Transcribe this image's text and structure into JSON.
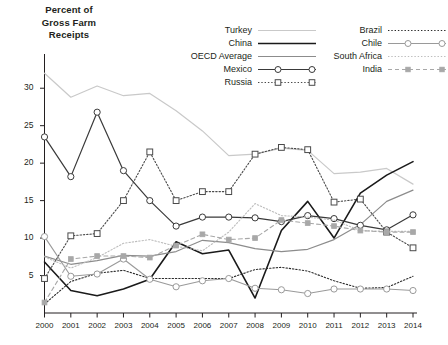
{
  "axis_title": "Percent of\nGross Farm\nReceipts",
  "axis_title_lines": [
    "Percent of",
    "Gross Farm",
    "Receipts"
  ],
  "legend": {
    "left_column": [
      {
        "label": "Turkey",
        "style": "solid-lightgray",
        "color": "#c9c9c9"
      },
      {
        "label": "China",
        "style": "solid-thick-black",
        "color": "#1a1a1a"
      },
      {
        "label": "OECD Average",
        "style": "solid-gray",
        "color": "#8c8c8c"
      },
      {
        "label": "Mexico",
        "style": "solid-marker-open-circle",
        "color": "#3a3a3a"
      },
      {
        "label": "Russia",
        "style": "dotted-marker-open-square",
        "color": "#4a4a4a"
      }
    ],
    "right_column": [
      {
        "label": "Brazil",
        "style": "dotted-dark",
        "color": "#2b2b2b"
      },
      {
        "label": "Chile",
        "style": "solid-marker-open-circle-light",
        "color": "#9a9a9a"
      },
      {
        "label": "South Africa",
        "style": "dotted-lightgray",
        "color": "#bdbdbd"
      },
      {
        "label": "India",
        "style": "dashed-marker-filled-square",
        "color": "#a8a8a8"
      }
    ]
  },
  "chart_data": {
    "type": "line",
    "title": "",
    "xlabel": "",
    "ylabel": "Percent of Gross Farm Receipts",
    "x": [
      2000,
      2001,
      2002,
      2003,
      2004,
      2005,
      2006,
      2007,
      2008,
      2009,
      2010,
      2011,
      2012,
      2013,
      2014
    ],
    "xtick_labels": [
      "2000",
      "2001",
      "2002",
      "2003",
      "2004",
      "2005",
      "2006",
      "2007",
      "2008",
      "2009",
      "2010",
      "2011",
      "2012",
      "2013",
      "2014"
    ],
    "ytick_labels": [
      "5",
      "10",
      "15",
      "20",
      "25",
      "30"
    ],
    "yticks": [
      5,
      10,
      15,
      20,
      25,
      30
    ],
    "ylim": [
      0,
      33.5
    ],
    "xlim": [
      2000,
      2014
    ],
    "grid": false,
    "legend_position": "top-right",
    "series": [
      {
        "name": "Turkey",
        "color": "#c9c9c9",
        "values": [
          32.0,
          28.8,
          30.3,
          29.0,
          29.3,
          27.0,
          24.3,
          21.0,
          21.2,
          22.0,
          21.7,
          18.6,
          18.8,
          19.3,
          17.2
        ],
        "marker": "none",
        "dash": "none",
        "width": 1.2
      },
      {
        "name": "China",
        "color": "#1a1a1a",
        "values": [
          6.8,
          3.0,
          2.3,
          3.2,
          4.5,
          9.5,
          7.9,
          8.4,
          2.0,
          11.0,
          14.9,
          10.0,
          16.0,
          18.4,
          20.2
        ],
        "marker": "none",
        "dash": "none",
        "width": 1.6
      },
      {
        "name": "OECD Average",
        "color": "#8c8c8c",
        "values": [
          7.6,
          6.5,
          7.0,
          7.7,
          7.6,
          8.2,
          9.7,
          9.4,
          8.6,
          8.2,
          8.5,
          9.8,
          11.8,
          14.9,
          16.4
        ],
        "marker": "none",
        "dash": "none",
        "width": 1.2
      },
      {
        "name": "Mexico",
        "color": "#3a3a3a",
        "values": [
          23.5,
          18.2,
          26.8,
          19.0,
          15.0,
          11.6,
          12.8,
          12.8,
          12.7,
          12.2,
          13.0,
          12.6,
          11.7,
          11.1,
          13.1
        ],
        "marker": "circle-open",
        "dash": "none",
        "width": 1.2
      },
      {
        "name": "Russia",
        "color": "#4a4a4a",
        "values": [
          4.6,
          10.3,
          10.6,
          15.0,
          21.5,
          15.0,
          16.2,
          16.2,
          21.2,
          22.1,
          21.8,
          14.8,
          15.2,
          10.8,
          8.7
        ],
        "marker": "square-open",
        "dash": "dotted",
        "width": 1.1
      },
      {
        "name": "Brazil",
        "color": "#2b2b2b",
        "values": [
          1.2,
          4.2,
          5.3,
          5.7,
          4.6,
          4.6,
          4.6,
          4.6,
          5.8,
          6.1,
          5.6,
          4.3,
          3.3,
          3.4,
          4.9
        ],
        "marker": "none",
        "dash": "dotted",
        "width": 1.1
      },
      {
        "name": "Chile",
        "color": "#9a9a9a",
        "values": [
          10.2,
          4.9,
          5.2,
          7.2,
          4.5,
          3.5,
          4.3,
          4.6,
          3.3,
          3.1,
          2.6,
          3.2,
          3.2,
          3.2,
          3.0
        ],
        "marker": "circle-open",
        "dash": "none",
        "width": 1.1
      },
      {
        "name": "South Africa",
        "color": "#bdbdbd",
        "values": [
          7.5,
          6.0,
          7.4,
          9.3,
          9.8,
          8.9,
          8.3,
          10.8,
          14.6,
          13.0,
          12.8,
          12.4,
          11.0,
          10.9,
          10.9
        ],
        "marker": "none",
        "dash": "dotted",
        "width": 1.1
      },
      {
        "name": "India",
        "color": "#a8a8a8",
        "values": [
          1.4,
          7.2,
          7.6,
          7.6,
          7.4,
          9.0,
          10.5,
          9.8,
          10.0,
          12.4,
          12.0,
          11.6,
          11.0,
          10.8,
          10.8
        ],
        "marker": "square-filled",
        "dash": "dashed",
        "width": 1.1
      }
    ]
  }
}
